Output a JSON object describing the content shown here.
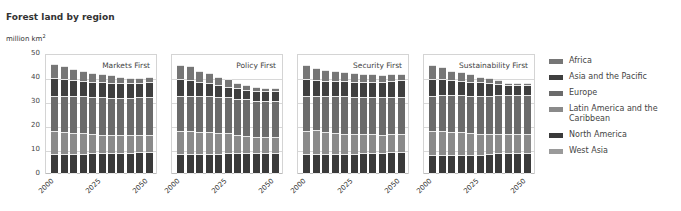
{
  "title": "Forest land by region",
  "unit_label": "million km",
  "unit_sup": "2",
  "legend": [
    {
      "label": "Africa",
      "color": "#767676"
    },
    {
      "label": "Asia and the Pacific",
      "color": "#3f3f3f"
    },
    {
      "label": "Europe",
      "color": "#6b6b6b"
    },
    {
      "label": "Latin America and the Caribbean",
      "color": "#8a8a8a"
    },
    {
      "label": "North America",
      "color": "#3a3a3a"
    },
    {
      "label": "West Asia",
      "color": "#9a9a9a"
    }
  ],
  "chart_data": [
    {
      "type": "bar",
      "stacked": true,
      "title": "Markets First",
      "ylabel": "million km2",
      "ylim": [
        0,
        50
      ],
      "yticks": [
        0,
        10,
        20,
        30,
        40,
        50
      ],
      "categories": [
        "2000",
        "2005",
        "2010",
        "2015",
        "2020",
        "2025",
        "2030",
        "2035",
        "2040",
        "2045",
        "2050"
      ],
      "xtick_labels": [
        "2000",
        "2025",
        "2050"
      ],
      "series": [
        {
          "name": "West Asia",
          "values": [
            0.3,
            0.3,
            0.3,
            0.3,
            0.3,
            0.3,
            0.3,
            0.3,
            0.3,
            0.3,
            0.3
          ]
        },
        {
          "name": "North America",
          "values": [
            8.0,
            8.0,
            8.0,
            8.0,
            8.2,
            8.2,
            8.2,
            8.2,
            8.4,
            8.6,
            8.6
          ]
        },
        {
          "name": "Latin America and the Caribbean",
          "values": [
            9.7,
            9.2,
            8.7,
            8.5,
            8.0,
            7.8,
            7.7,
            7.6,
            7.5,
            7.4,
            7.4
          ]
        },
        {
          "name": "Europe",
          "values": [
            14.5,
            15.0,
            15.5,
            15.7,
            15.5,
            15.5,
            15.3,
            15.3,
            15.3,
            15.5,
            15.5
          ]
        },
        {
          "name": "Asia and the Pacific",
          "values": [
            7.3,
            7.0,
            6.4,
            6.3,
            6.4,
            6.4,
            6.5,
            6.5,
            6.2,
            6.0,
            6.5
          ]
        },
        {
          "name": "Africa",
          "values": [
            6.0,
            5.3,
            4.6,
            4.2,
            3.6,
            3.3,
            3.0,
            2.6,
            2.3,
            2.2,
            2.2
          ]
        }
      ]
    },
    {
      "type": "bar",
      "stacked": true,
      "title": "Policy First",
      "ylabel": "million km2",
      "ylim": [
        0,
        50
      ],
      "yticks": [
        0,
        10,
        20,
        30,
        40,
        50
      ],
      "categories": [
        "2000",
        "2005",
        "2010",
        "2015",
        "2020",
        "2025",
        "2030",
        "2035",
        "2040",
        "2045",
        "2050"
      ],
      "xtick_labels": [
        "2000",
        "2025",
        "2050"
      ],
      "series": [
        {
          "name": "West Asia",
          "values": [
            0.3,
            0.3,
            0.3,
            0.3,
            0.3,
            0.3,
            0.3,
            0.3,
            0.3,
            0.3,
            0.3
          ]
        },
        {
          "name": "North America",
          "values": [
            8.0,
            8.0,
            8.0,
            8.0,
            8.0,
            8.2,
            8.2,
            8.2,
            8.2,
            8.2,
            8.2
          ]
        },
        {
          "name": "Latin America and the Caribbean",
          "values": [
            9.7,
            9.5,
            9.3,
            9.0,
            8.6,
            8.3,
            7.8,
            7.3,
            6.8,
            6.8,
            6.8
          ]
        },
        {
          "name": "Europe",
          "values": [
            14.5,
            14.8,
            14.7,
            15.0,
            15.0,
            15.0,
            15.0,
            15.2,
            15.2,
            15.2,
            15.2
          ]
        },
        {
          "name": "Asia and the Pacific",
          "values": [
            7.0,
            6.5,
            6.0,
            5.5,
            5.0,
            4.5,
            4.3,
            4.0,
            4.0,
            4.0,
            4.0
          ]
        },
        {
          "name": "Africa",
          "values": [
            6.0,
            5.7,
            4.7,
            4.2,
            3.6,
            3.2,
            2.4,
            2.0,
            1.5,
            1.3,
            1.3
          ]
        }
      ]
    },
    {
      "type": "bar",
      "stacked": true,
      "title": "Security First",
      "ylabel": "million km2",
      "ylim": [
        0,
        50
      ],
      "yticks": [
        0,
        10,
        20,
        30,
        40,
        50
      ],
      "categories": [
        "2000",
        "2005",
        "2010",
        "2015",
        "2020",
        "2025",
        "2030",
        "2035",
        "2040",
        "2045",
        "2050"
      ],
      "xtick_labels": [
        "2000",
        "2025",
        "2050"
      ],
      "series": [
        {
          "name": "West Asia",
          "values": [
            0.3,
            0.3,
            0.3,
            0.3,
            0.3,
            0.3,
            0.3,
            0.3,
            0.3,
            0.3,
            0.3
          ]
        },
        {
          "name": "North America",
          "values": [
            8.0,
            8.0,
            8.0,
            8.0,
            8.0,
            8.0,
            8.2,
            8.4,
            8.4,
            8.6,
            8.6
          ]
        },
        {
          "name": "Latin America and the Caribbean",
          "values": [
            9.7,
            9.8,
            8.9,
            8.7,
            8.3,
            8.2,
            7.9,
            7.8,
            7.6,
            7.6,
            7.6
          ]
        },
        {
          "name": "Europe",
          "values": [
            14.5,
            14.4,
            15.4,
            15.5,
            15.6,
            15.6,
            15.6,
            15.5,
            15.5,
            15.5,
            15.5
          ]
        },
        {
          "name": "Asia and the Pacific",
          "values": [
            7.0,
            6.5,
            6.2,
            6.3,
            6.3,
            6.2,
            6.3,
            6.3,
            6.3,
            6.7,
            6.9
          ]
        },
        {
          "name": "Africa",
          "values": [
            6.0,
            5.0,
            4.5,
            4.0,
            4.0,
            3.5,
            3.2,
            3.2,
            2.9,
            2.8,
            2.6
          ]
        }
      ]
    },
    {
      "type": "bar",
      "stacked": true,
      "title": "Sustainability First",
      "ylabel": "million km2",
      "ylim": [
        0,
        50
      ],
      "yticks": [
        0,
        10,
        20,
        30,
        40,
        50
      ],
      "categories": [
        "2000",
        "2005",
        "2010",
        "2015",
        "2020",
        "2025",
        "2030",
        "2035",
        "2040",
        "2045",
        "2050"
      ],
      "xtick_labels": [
        "2000",
        "2025",
        "2050"
      ],
      "series": [
        {
          "name": "West Asia",
          "values": [
            0.3,
            0.3,
            0.3,
            0.3,
            0.3,
            0.3,
            0.3,
            0.3,
            0.3,
            0.3,
            0.3
          ]
        },
        {
          "name": "North America",
          "values": [
            7.7,
            7.7,
            7.7,
            7.7,
            7.7,
            7.7,
            7.9,
            8.2,
            8.4,
            8.4,
            8.4
          ]
        },
        {
          "name": "Latin America and the Caribbean",
          "values": [
            9.7,
            9.8,
            9.5,
            9.2,
            8.8,
            8.7,
            8.3,
            8.1,
            7.8,
            7.7,
            7.7
          ]
        },
        {
          "name": "Europe",
          "values": [
            14.8,
            14.9,
            15.2,
            15.5,
            15.6,
            15.8,
            16.0,
            16.2,
            16.3,
            16.4,
            16.4
          ]
        },
        {
          "name": "Asia and the Pacific",
          "values": [
            7.0,
            6.6,
            6.2,
            5.9,
            5.9,
            5.8,
            5.3,
            4.8,
            4.3,
            4.3,
            4.3
          ]
        },
        {
          "name": "Africa",
          "values": [
            6.0,
            5.2,
            4.1,
            3.7,
            3.2,
            2.2,
            2.2,
            1.4,
            0.9,
            0.9,
            0.9
          ]
        }
      ]
    }
  ]
}
